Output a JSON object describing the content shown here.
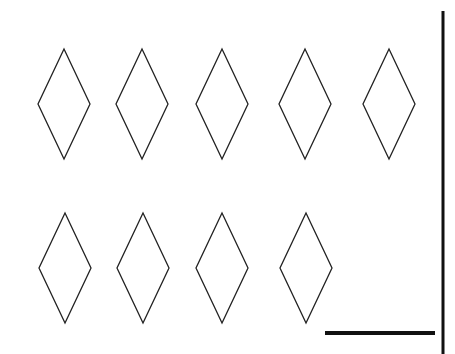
{
  "worksheet": {
    "description": "Count-the-shapes worksheet with 9 diamonds and a blank answer line",
    "shape": "diamond",
    "count": 9,
    "rows": [
      {
        "diamonds": [
          {
            "cx": 64,
            "cy": 104
          },
          {
            "cx": 142,
            "cy": 104
          },
          {
            "cx": 222,
            "cy": 104
          },
          {
            "cx": 305,
            "cy": 104
          },
          {
            "cx": 389,
            "cy": 104
          }
        ]
      },
      {
        "diamonds": [
          {
            "cx": 65,
            "cy": 268
          },
          {
            "cx": 143,
            "cy": 268
          },
          {
            "cx": 222,
            "cy": 268
          },
          {
            "cx": 306,
            "cy": 268
          }
        ]
      }
    ],
    "answer_line": {
      "x1": 325,
      "x2": 435,
      "y": 333
    },
    "divider": {
      "x": 443,
      "y1": 11,
      "y2": 354
    },
    "stroke_color": "#222222"
  }
}
